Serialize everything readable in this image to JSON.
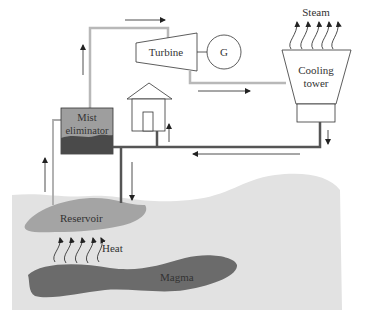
{
  "diagram": {
    "type": "geothermal power plant schematic",
    "labels": {
      "steam": "Steam",
      "turbine": "Turbine",
      "generator": "G",
      "cooling_tower_line1": "Cooling",
      "cooling_tower_line2": "tower",
      "mist_line1": "Mist",
      "mist_line2": "eliminator",
      "reservoir": "Reservoir",
      "heat": "Heat",
      "magma": "Magma"
    },
    "colors": {
      "ground": "#e2e2e2",
      "reservoir": "#a4a4a4",
      "magma": "#6b6b6b",
      "mist_box_top": "#9e9e9e",
      "mist_box_bottom": "#4a4a4a",
      "steam_pipe": "#b8b8b8",
      "water_pipe": "#555555",
      "outline": "#333333"
    },
    "components": [
      "Mist eliminator",
      "Turbine",
      "Generator (G)",
      "Cooling tower",
      "House",
      "Reservoir",
      "Magma"
    ],
    "flows": [
      "Steam from mist eliminator up to turbine",
      "Turbine exhaust to cooling tower",
      "Steam released from cooling tower",
      "Water from cooling tower back to reservoir",
      "Water from mist eliminator to house",
      "Heat from magma rising to reservoir"
    ]
  }
}
